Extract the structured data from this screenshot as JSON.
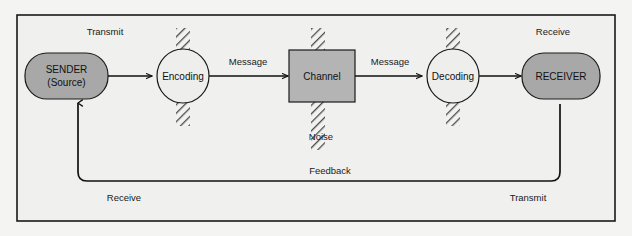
{
  "diagram": {
    "background_color": "#f2f2f0",
    "frame_color": "#1a1a1a",
    "nodes": {
      "sender": {
        "label_line1": "SENDER",
        "label_line2": "(Source)",
        "shape": "rounded-rectangle",
        "fill": "#a8a8a8"
      },
      "encoding": {
        "label": "Encoding",
        "shape": "circle",
        "fill": "#eeeeec"
      },
      "channel": {
        "label": "Channel",
        "shape": "rectangle",
        "fill": "#b4b4b4"
      },
      "decoding": {
        "label": "Decoding",
        "shape": "circle",
        "fill": "#eeeeec"
      },
      "receiver": {
        "label": "RECEIVER",
        "shape": "rounded-rectangle",
        "fill": "#a8a8a8"
      }
    },
    "edge_labels": {
      "transmit_top": "Transmit",
      "receive_top": "Receive",
      "message_1": "Message",
      "message_2": "Message",
      "noise": "Noise",
      "feedback": "Feedback",
      "receive_bottom": "Receive",
      "transmit_bottom": "Transmit"
    },
    "noise_bars": {
      "name": "noise-hatch-bar",
      "count": 3,
      "hatch_color": "#4a4a4a",
      "fill": "#f2f2f0"
    }
  }
}
